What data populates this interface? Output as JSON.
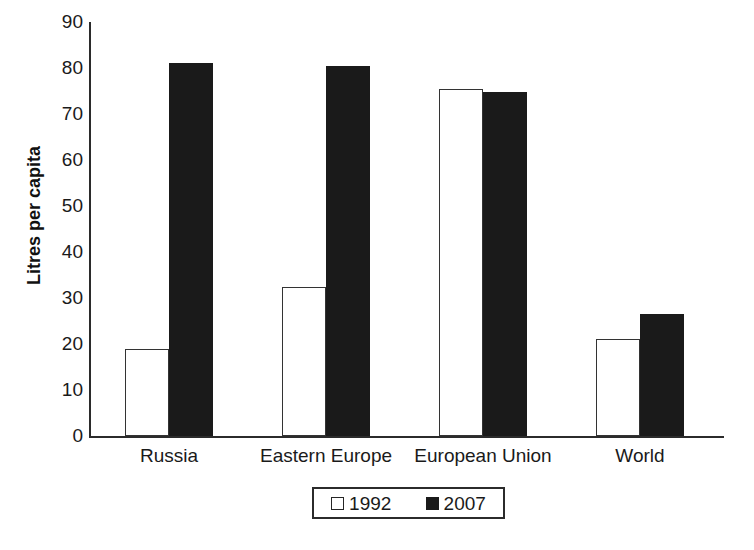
{
  "chart_data": {
    "type": "bar",
    "title": "",
    "xlabel": "",
    "ylabel": "Litres per capita",
    "ylim": [
      0,
      90
    ],
    "ytick_step": 10,
    "yticks": [
      "90",
      "80",
      "70",
      "60",
      "50",
      "40",
      "30",
      "20",
      "10",
      "0"
    ],
    "grid": false,
    "legend_position": "bottom-center",
    "categories": [
      "Russia",
      "Eastern Europe",
      "European Union",
      "World"
    ],
    "series": [
      {
        "name": "1992",
        "style": "open",
        "color": "#ffffff",
        "edge_color": "#333333",
        "values": [
          19,
          32.5,
          75.5,
          21
        ]
      },
      {
        "name": "2007",
        "style": "filled",
        "color": "#1a1a1a",
        "edge_color": "#1a1a1a",
        "values": [
          81,
          80.5,
          74.8,
          26.5
        ]
      }
    ]
  },
  "legend": {
    "items": [
      {
        "label": "1992",
        "swatch": "open-square-swatch"
      },
      {
        "label": "2007",
        "swatch": "filled-square-swatch"
      }
    ]
  },
  "axis": {
    "y_title": "Litres per capita"
  }
}
